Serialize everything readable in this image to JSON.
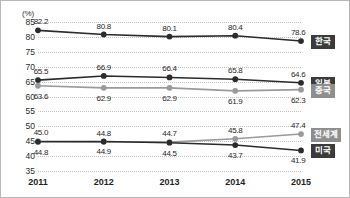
{
  "chart_data": {
    "type": "line",
    "title": "",
    "xlabel": "",
    "ylabel": "(%)",
    "unit_label": "(%)",
    "categories": [
      "2011",
      "2012",
      "2013",
      "2014",
      "2015"
    ],
    "x": [
      2011,
      2012,
      2013,
      2014,
      2015
    ],
    "ylim": [
      35,
      85
    ],
    "ytick_step": 5,
    "yticks": [
      85,
      80,
      75,
      70,
      65,
      60,
      55,
      50,
      45,
      40,
      35
    ],
    "grid": true,
    "legend_position": "right",
    "series": [
      {
        "name": "한국",
        "color": "#2b2b2b",
        "marker": "circle",
        "values": [
          82.2,
          80.8,
          80.1,
          80.4,
          78.6
        ],
        "labels": [
          "82.2",
          "80.8",
          "80.1",
          "80.4",
          "78.6"
        ]
      },
      {
        "name": "일본",
        "color": "#2b2b2b",
        "marker": "circle",
        "values": [
          65.5,
          66.9,
          66.4,
          65.8,
          64.6
        ],
        "labels": [
          "65.5",
          "66.9",
          "66.4",
          "65.8",
          "64.6"
        ]
      },
      {
        "name": "중국",
        "color": "#9a9a9a",
        "marker": "circle",
        "values": [
          63.6,
          62.9,
          62.9,
          61.9,
          62.3
        ],
        "labels": [
          "63.6",
          "62.9",
          "62.9",
          "61.9",
          "62.3"
        ]
      },
      {
        "name": "전세계",
        "color": "#9a9a9a",
        "marker": "circle",
        "values": [
          45.0,
          44.8,
          44.7,
          45.8,
          47.4
        ],
        "labels": [
          "45.0",
          "44.8",
          "44.7",
          "45.8",
          "47.4"
        ]
      },
      {
        "name": "미국",
        "color": "#2b2b2b",
        "marker": "circle",
        "values": [
          44.8,
          44.9,
          44.5,
          43.7,
          41.9
        ],
        "labels": [
          "44.8",
          "44.9",
          "44.5",
          "43.7",
          "41.9"
        ]
      }
    ]
  },
  "legend": {
    "items": [
      {
        "label": "한국",
        "style": "dark"
      },
      {
        "label": "일본",
        "style": "dark"
      },
      {
        "label": "중국",
        "style": "gray"
      },
      {
        "label": "전세계",
        "style": "gray"
      },
      {
        "label": "미국",
        "style": "dark"
      }
    ]
  },
  "colors": {
    "dark": "#2b2b2b",
    "gray": "#9a9a9a",
    "grid": "#c3c3c3",
    "border": "#b9b9b9",
    "background": "#ffffff"
  }
}
